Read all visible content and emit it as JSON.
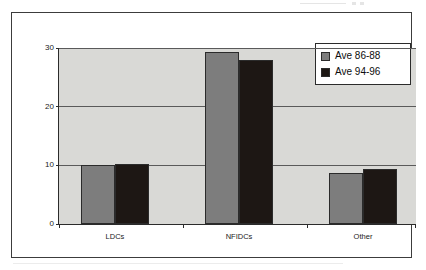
{
  "chart_data": {
    "type": "bar",
    "title": "",
    "subtitle": "",
    "xlabel": "",
    "ylabel": "",
    "categories": [
      "LDCs",
      "NFIDCs",
      "Other"
    ],
    "series": [
      {
        "name": "Ave 86-88",
        "color": "#7d7d7d",
        "values": [
          10.0,
          29.3,
          8.7
        ]
      },
      {
        "name": "Ave 94-96",
        "color": "#1d1714",
        "values": [
          10.2,
          28.0,
          9.3
        ]
      }
    ],
    "ylim": [
      0,
      30
    ],
    "yticks": [
      0,
      10,
      20,
      30
    ],
    "ytick_labels": [
      "0",
      "10",
      "20",
      "30"
    ],
    "grid": true,
    "legend_position": "top-right",
    "plot_background": "#d9d9d6",
    "frame_color": "#3c3c3c"
  },
  "legend": {
    "entries": [
      {
        "label": "Ave 86-88"
      },
      {
        "label": "Ave 94-96"
      }
    ]
  }
}
